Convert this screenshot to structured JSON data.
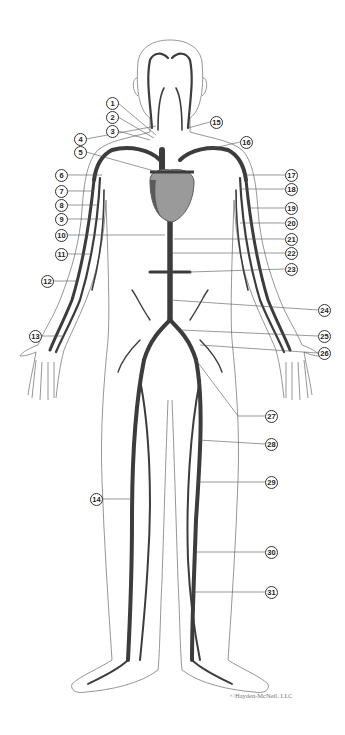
{
  "diagram": {
    "colors": {
      "outline": "#8a8a8a",
      "vein": "#3c3c3c",
      "heart": "#9a9a9a",
      "heart_shadow": "#5a5a5a",
      "leader": "#555555"
    },
    "copyright": "©Hayden-McNeil, LLC",
    "callouts": [
      {
        "n": "1",
        "x": 106,
        "y": 97
      },
      {
        "n": "2",
        "x": 106,
        "y": 111
      },
      {
        "n": "3",
        "x": 106,
        "y": 125
      },
      {
        "n": "4",
        "x": 74,
        "y": 133
      },
      {
        "n": "5",
        "x": 74,
        "y": 146
      },
      {
        "n": "6",
        "x": 55,
        "y": 169
      },
      {
        "n": "7",
        "x": 55,
        "y": 185
      },
      {
        "n": "8",
        "x": 55,
        "y": 199
      },
      {
        "n": "9",
        "x": 55,
        "y": 213
      },
      {
        "n": "10",
        "x": 55,
        "y": 229
      },
      {
        "n": "11",
        "x": 55,
        "y": 248
      },
      {
        "n": "12",
        "x": 41,
        "y": 275
      },
      {
        "n": "13",
        "x": 29,
        "y": 330
      },
      {
        "n": "14",
        "x": 90,
        "y": 493
      },
      {
        "n": "15",
        "x": 210,
        "y": 116
      },
      {
        "n": "16",
        "x": 240,
        "y": 136
      },
      {
        "n": "17",
        "x": 285,
        "y": 169
      },
      {
        "n": "18",
        "x": 285,
        "y": 183
      },
      {
        "n": "19",
        "x": 285,
        "y": 202
      },
      {
        "n": "20",
        "x": 285,
        "y": 217
      },
      {
        "n": "21",
        "x": 285,
        "y": 233
      },
      {
        "n": "22",
        "x": 285,
        "y": 247
      },
      {
        "n": "23",
        "x": 285,
        "y": 263
      },
      {
        "n": "24",
        "x": 318,
        "y": 304
      },
      {
        "n": "25",
        "x": 318,
        "y": 330
      },
      {
        "n": "26",
        "x": 318,
        "y": 347
      },
      {
        "n": "27",
        "x": 265,
        "y": 410
      },
      {
        "n": "28",
        "x": 265,
        "y": 438
      },
      {
        "n": "29",
        "x": 265,
        "y": 476
      },
      {
        "n": "30",
        "x": 265,
        "y": 546
      },
      {
        "n": "31",
        "x": 265,
        "y": 586
      }
    ]
  }
}
